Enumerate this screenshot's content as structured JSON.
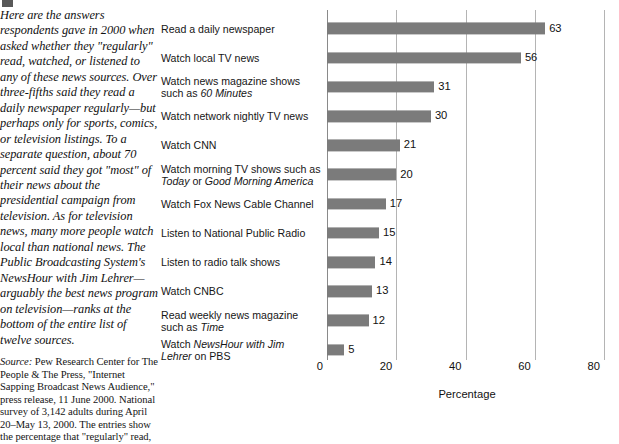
{
  "caption": {
    "body": "Here are the answers respondents gave in 2000 when asked whether they \"regularly\" read, watched, or listened to any of these news sources. Over three-fifths said they read a daily newspaper regularly—but perhaps only for sports, comics, or television listings. To a separate question, about 70 percent said they got \"most\" of their news about the presidential campaign from television. As for television news, many more people watch local than national news. The Public Broadcasting System's NewsHour with Jim Lehrer—arguably the best news program on television—ranks at the bottom of the entire list of twelve sources."
  },
  "source": {
    "label": "Source:",
    "text": " Pew Research Center for The People & The Press, \"Internet Sapping Broadcast News Audience,\" press release, 11 June 2000. National survey of 3,142 adults during April 20–May 13, 2000. The entries show the percentage that \"regularly\" read,"
  },
  "chart_data": {
    "type": "bar",
    "orientation": "horizontal",
    "title": "",
    "xlabel": "Percentage",
    "ylabel": "",
    "xlim": [
      0,
      80
    ],
    "xticks": [
      0,
      20,
      40,
      60,
      80
    ],
    "grid": true,
    "legend": false,
    "bar_color": "#7b7b7b",
    "categories": [
      "Read a daily newspaper",
      "Watch local TV news",
      "Watch news magazine shows such as 60 Minutes",
      "Watch network nightly TV news",
      "Watch CNN",
      "Watch morning TV shows such as Today or Good Morning America",
      "Watch Fox News Cable Channel",
      "Listen to National Public Radio",
      "Listen to radio talk shows",
      "Watch CNBC",
      "Read weekly news magazine such as Time",
      "Watch NewsHour with Jim Lehrer on PBS"
    ],
    "values": [
      63,
      56,
      31,
      30,
      21,
      20,
      17,
      15,
      14,
      13,
      12,
      5
    ],
    "bars": [
      {
        "label_html": "Read a daily newspaper",
        "value": 63
      },
      {
        "label_html": "Watch local TV news",
        "value": 56
      },
      {
        "label_html": "Watch news magazine shows\nsuch as <i>60 Minutes</i>",
        "value": 31
      },
      {
        "label_html": "Watch network nightly TV news",
        "value": 30
      },
      {
        "label_html": "Watch CNN",
        "value": 21
      },
      {
        "label_html": "Watch morning TV shows such as\n<i>Today</i> or <i>Good Morning America</i>",
        "value": 20
      },
      {
        "label_html": "Watch Fox News Cable Channel",
        "value": 17
      },
      {
        "label_html": "Listen to National Public Radio",
        "value": 15
      },
      {
        "label_html": "Listen to radio talk shows",
        "value": 14
      },
      {
        "label_html": "Watch CNBC",
        "value": 13
      },
      {
        "label_html": "Read weekly news magazine\nsuch as <i>Time</i>",
        "value": 12
      },
      {
        "label_html": "Watch <i>NewsHour with Jim\nLehrer</i> on PBS",
        "value": 5
      }
    ]
  }
}
